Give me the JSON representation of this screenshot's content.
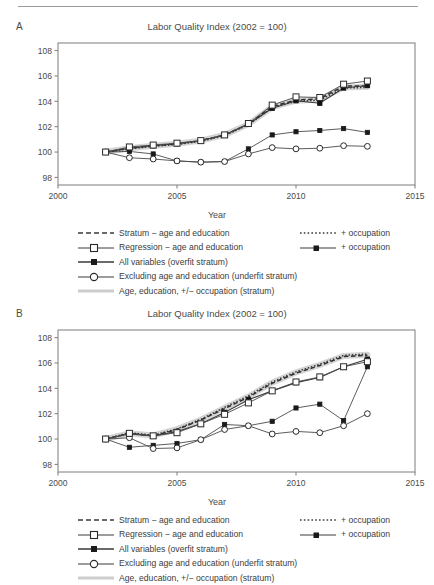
{
  "figure": {
    "panels": [
      {
        "letter": "A",
        "title": "Labor Quality Index (2002 = 100)",
        "xlabel": "Year"
      },
      {
        "letter": "B",
        "title": "Labor Quality Index (2002 = 100)",
        "xlabel": "Year"
      }
    ],
    "legend": {
      "left_items": [
        {
          "label": "Stratum − age and education",
          "symbol": "dashed-line"
        },
        {
          "label": "Regression − age and education",
          "symbol": "line-open-square"
        },
        {
          "label": "All variables (overfit stratum)",
          "symbol": "line-filled-square"
        },
        {
          "label": "Excluding age and education (underfit stratum)",
          "symbol": "line-open-circle"
        },
        {
          "label": "Age, education, +/− occupation (stratum)",
          "symbol": "thick-gray-band"
        }
      ],
      "right_items": [
        {
          "label": "+ occupation",
          "symbol": "dotted-line"
        },
        {
          "label": "+ occupation",
          "symbol": "line-filled-square-small"
        }
      ]
    }
  },
  "chart_data": [
    {
      "type": "line",
      "panel": "A",
      "title": "Labor Quality Index (2002 = 100)",
      "xlabel": "Year",
      "ylabel": "",
      "xlim": [
        2000,
        2015
      ],
      "ylim": [
        97.4,
        108.6
      ],
      "xticks": [
        2000,
        2005,
        2010,
        2015
      ],
      "yticks": [
        98,
        100,
        102,
        104,
        106,
        108
      ],
      "grid": false,
      "legend_position": "below",
      "x": [
        2002,
        2003,
        2004,
        2005,
        2006,
        2007,
        2008,
        2009,
        2010,
        2011,
        2012,
        2013
      ],
      "series": [
        {
          "name": "Stratum − age and education",
          "style": "dashed",
          "values": [
            100.0,
            100.3,
            100.5,
            100.65,
            100.9,
            101.35,
            102.2,
            103.6,
            104.1,
            104.2,
            105.2,
            105.2
          ]
        },
        {
          "name": "Stratum − age and education + occupation",
          "style": "dotted",
          "values": [
            100.0,
            100.25,
            100.45,
            100.6,
            100.85,
            101.3,
            102.15,
            103.5,
            104.0,
            104.1,
            105.05,
            105.1
          ]
        },
        {
          "name": "Regression − age and education",
          "style": "solid-open-square",
          "values": [
            100.0,
            100.4,
            100.55,
            100.7,
            100.9,
            101.35,
            102.25,
            103.7,
            104.35,
            104.3,
            105.35,
            105.6
          ]
        },
        {
          "name": "Regression − age and education + occupation",
          "style": "solid-filled-square",
          "values": [
            100.0,
            100.3,
            100.5,
            100.65,
            100.9,
            101.35,
            102.2,
            103.45,
            104.05,
            103.85,
            105.05,
            105.25
          ]
        },
        {
          "name": "All variables (overfit stratum)",
          "style": "solid-filled-square-lower",
          "values": [
            100.0,
            100.05,
            99.85,
            99.3,
            99.2,
            99.25,
            100.25,
            101.35,
            101.6,
            101.7,
            101.85,
            101.55
          ]
        },
        {
          "name": "Excluding age and education (underfit stratum)",
          "style": "solid-open-circle",
          "values": [
            100.0,
            99.55,
            99.45,
            99.3,
            99.2,
            99.25,
            99.85,
            100.35,
            100.25,
            100.3,
            100.5,
            100.45
          ]
        },
        {
          "name": "Age, education, +/− occupation (stratum)",
          "style": "gray-band",
          "values": [
            100.0,
            100.3,
            100.5,
            100.65,
            100.9,
            101.35,
            102.2,
            103.55,
            104.05,
            104.15,
            105.1,
            105.15
          ]
        }
      ]
    },
    {
      "type": "line",
      "panel": "B",
      "title": "Labor Quality Index (2002 = 100)",
      "xlabel": "Year",
      "ylabel": "",
      "xlim": [
        2000,
        2015
      ],
      "ylim": [
        97.4,
        108.6
      ],
      "xticks": [
        2000,
        2005,
        2010,
        2015
      ],
      "yticks": [
        98,
        100,
        102,
        104,
        106,
        108
      ],
      "grid": false,
      "legend_position": "below",
      "x": [
        2002,
        2003,
        2004,
        2005,
        2006,
        2007,
        2008,
        2009,
        2010,
        2011,
        2012,
        2013
      ],
      "series": [
        {
          "name": "Stratum − age and education",
          "style": "dashed",
          "values": [
            100.0,
            100.45,
            100.25,
            100.75,
            101.5,
            102.4,
            103.3,
            104.4,
            105.2,
            105.8,
            106.5,
            106.6
          ]
        },
        {
          "name": "Stratum − age and education + occupation",
          "style": "dotted",
          "values": [
            100.0,
            100.5,
            100.3,
            100.8,
            101.55,
            102.5,
            103.4,
            104.5,
            105.3,
            105.9,
            106.6,
            106.7
          ]
        },
        {
          "name": "Regression − age and education",
          "style": "solid-open-square",
          "values": [
            100.0,
            100.45,
            100.25,
            100.5,
            101.2,
            101.95,
            102.85,
            103.8,
            104.5,
            104.9,
            105.7,
            106.1
          ]
        },
        {
          "name": "Regression − age and education + occupation",
          "style": "solid-filled-square",
          "values": [
            100.0,
            100.4,
            100.25,
            100.6,
            101.2,
            102.1,
            103.1,
            103.8,
            104.45,
            104.85,
            105.7,
            106.3
          ]
        },
        {
          "name": "All variables (overfit stratum)",
          "style": "solid-filled-square-lower",
          "values": [
            100.0,
            99.35,
            99.5,
            99.65,
            99.95,
            101.15,
            101.05,
            101.4,
            102.45,
            102.75,
            101.45,
            105.7
          ]
        },
        {
          "name": "Excluding age and education (underfit stratum)",
          "style": "solid-open-circle",
          "values": [
            100.0,
            100.1,
            99.25,
            99.3,
            99.95,
            100.75,
            101.05,
            100.4,
            100.6,
            100.5,
            101.05,
            102.0
          ]
        },
        {
          "name": "Age, education, +/− occupation (stratum)",
          "style": "gray-band",
          "values": [
            100.0,
            100.45,
            100.28,
            100.78,
            101.52,
            102.45,
            103.35,
            104.45,
            105.25,
            105.85,
            106.55,
            106.65
          ]
        }
      ]
    }
  ]
}
